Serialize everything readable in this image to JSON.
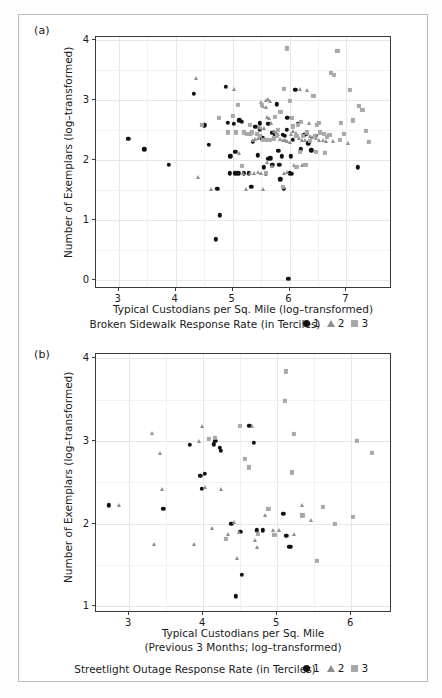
{
  "figure": {
    "panels": [
      {
        "label": "(a)",
        "legend_title": "Broken Sidewalk Response Rate (in Terciles)",
        "legend_items": [
          {
            "symbol": "circle",
            "label": "1"
          },
          {
            "symbol": "triangle",
            "label": "2"
          },
          {
            "symbol": "square",
            "label": "3"
          }
        ]
      },
      {
        "label": "(b)",
        "legend_title": "Streetlight Outage Response Rate (in Terciles)",
        "legend_items": [
          {
            "symbol": "circle",
            "label": "1"
          },
          {
            "symbol": "triangle",
            "label": "2"
          },
          {
            "symbol": "square",
            "label": "3"
          }
        ]
      }
    ]
  },
  "chart_data": [
    {
      "type": "scatter",
      "panel": "(a)",
      "title": "",
      "xlabel": "Typical Custodians per Sq. Mile (log–transformed)",
      "ylabel": "Number of Exemplars (log–transformed)",
      "xlim": [
        2.6,
        7.8
      ],
      "ylim": [
        -0.15,
        4.05
      ],
      "xticks": [
        3,
        4,
        5,
        6,
        7
      ],
      "yticks": [
        0,
        1,
        2,
        3,
        4
      ],
      "grid": true,
      "legend_position": "below-axis",
      "legend_title": "Broken Sidewalk Response Rate (in Terciles)",
      "series": [
        {
          "name": "1",
          "marker": "circle",
          "color": "#111111",
          "points": [
            [
              3.17,
              2.35
            ],
            [
              3.45,
              2.18
            ],
            [
              3.88,
              1.92
            ],
            [
              4.32,
              3.1
            ],
            [
              4.5,
              2.58
            ],
            [
              4.58,
              2.25
            ],
            [
              4.88,
              3.22
            ],
            [
              4.92,
              2.62
            ],
            [
              5.02,
              2.6
            ],
            [
              5.12,
              2.66
            ],
            [
              5.16,
              2.64
            ],
            [
              4.96,
              2.06
            ],
            [
              5.05,
              2.14
            ],
            [
              5.2,
              1.78
            ],
            [
              5.28,
              1.78
            ],
            [
              5.33,
              1.55
            ],
            [
              5.4,
              2.55
            ],
            [
              5.48,
              2.5
            ],
            [
              5.52,
              2.36
            ],
            [
              5.55,
              1.88
            ],
            [
              5.58,
              1.77
            ],
            [
              5.62,
              2.02
            ],
            [
              5.66,
              2.03
            ],
            [
              5.7,
              2.45
            ],
            [
              5.74,
              2.4
            ],
            [
              5.78,
              2.93
            ],
            [
              5.8,
              2.15
            ],
            [
              5.84,
              1.68
            ],
            [
              5.88,
              2.42
            ],
            [
              5.92,
              2.4
            ],
            [
              5.96,
              2.7
            ],
            [
              6.0,
              1.78
            ],
            [
              6.04,
              1.77
            ],
            [
              6.1,
              3.17
            ],
            [
              6.14,
              2.6
            ],
            [
              6.2,
              2.18
            ],
            [
              6.3,
              2.44
            ],
            [
              6.38,
              2.16
            ],
            [
              6.46,
              2.4
            ],
            [
              5.05,
              1.78
            ],
            [
              5.1,
              1.78
            ],
            [
              4.73,
              1.52
            ],
            [
              4.78,
              1.08
            ],
            [
              4.7,
              0.68
            ],
            [
              5.9,
              1.52
            ],
            [
              5.98,
              0.02
            ],
            [
              7.2,
              1.88
            ],
            [
              5.35,
              2.3
            ],
            [
              5.44,
              2.08
            ],
            [
              5.86,
              2.06
            ],
            [
              6.02,
              2.06
            ],
            [
              6.26,
              2.42
            ],
            [
              5.48,
              2.61
            ],
            [
              5.63,
              2.6
            ],
            [
              5.95,
              2.5
            ],
            [
              6.33,
              2.28
            ],
            [
              4.95,
              1.78
            ],
            [
              5.7,
              1.92
            ],
            [
              5.82,
              1.92
            ],
            [
              6.06,
              2.34
            ]
          ]
        },
        {
          "name": "2",
          "marker": "triangle",
          "color": "#8f8f8f",
          "points": [
            [
              4.36,
              3.36
            ],
            [
              4.4,
              1.72
            ],
            [
              4.62,
              1.52
            ],
            [
              5.02,
              3.19
            ],
            [
              5.22,
              2.46
            ],
            [
              5.3,
              2.44
            ],
            [
              5.36,
              2.34
            ],
            [
              5.4,
              2.35
            ],
            [
              5.44,
              2.36
            ],
            [
              5.5,
              2.97
            ],
            [
              5.54,
              2.9
            ],
            [
              5.58,
              2.88
            ],
            [
              5.6,
              2.72
            ],
            [
              5.64,
              2.7
            ],
            [
              5.68,
              2.62
            ],
            [
              5.72,
              2.48
            ],
            [
              5.76,
              2.46
            ],
            [
              5.8,
              2.44
            ],
            [
              5.84,
              2.35
            ],
            [
              5.88,
              2.34
            ],
            [
              5.92,
              2.33
            ],
            [
              5.96,
              2.31
            ],
            [
              6.0,
              2.3
            ],
            [
              6.06,
              2.48
            ],
            [
              6.12,
              2.45
            ],
            [
              6.16,
              2.36
            ],
            [
              6.22,
              2.34
            ],
            [
              6.28,
              2.33
            ],
            [
              6.34,
              2.62
            ],
            [
              6.4,
              2.38
            ],
            [
              6.46,
              2.36
            ],
            [
              6.52,
              2.34
            ],
            [
              6.58,
              2.34
            ],
            [
              6.64,
              2.32
            ],
            [
              6.76,
              2.32
            ],
            [
              7.02,
              2.28
            ],
            [
              5.12,
              2.12
            ],
            [
              5.18,
              1.78
            ],
            [
              5.3,
              1.78
            ],
            [
              5.38,
              1.78
            ],
            [
              5.44,
              1.8
            ],
            [
              5.5,
              1.78
            ],
            [
              5.6,
              1.96
            ],
            [
              5.7,
              1.9
            ],
            [
              5.9,
              1.78
            ],
            [
              5.96,
              1.8
            ],
            [
              6.08,
              1.92
            ],
            [
              6.22,
              1.92
            ],
            [
              5.24,
              1.52
            ],
            [
              5.54,
              1.52
            ],
            [
              6.18,
              3.19
            ],
            [
              6.3,
              3.16
            ],
            [
              5.46,
              2.55
            ],
            [
              5.5,
              2.53
            ],
            [
              5.56,
              2.54
            ],
            [
              5.58,
              3.0
            ],
            [
              5.62,
              3.02
            ],
            [
              5.66,
              2.98
            ],
            [
              6.02,
              2.44
            ],
            [
              6.36,
              2.4
            ]
          ]
        },
        {
          "name": "3",
          "marker": "square",
          "color": "#a8a8a8",
          "points": [
            [
              4.46,
              2.58
            ],
            [
              4.76,
              2.7
            ],
            [
              5.0,
              2.74
            ],
            [
              5.1,
              2.92
            ],
            [
              5.2,
              2.46
            ],
            [
              5.26,
              2.44
            ],
            [
              5.34,
              2.46
            ],
            [
              5.42,
              2.44
            ],
            [
              5.48,
              2.4
            ],
            [
              5.54,
              2.33
            ],
            [
              5.6,
              2.33
            ],
            [
              5.66,
              2.34
            ],
            [
              5.72,
              2.36
            ],
            [
              5.78,
              2.4
            ],
            [
              5.84,
              2.8
            ],
            [
              5.9,
              3.19
            ],
            [
              5.96,
              3.86
            ],
            [
              6.0,
              2.98
            ],
            [
              6.06,
              2.56
            ],
            [
              6.12,
              2.4
            ],
            [
              6.18,
              2.14
            ],
            [
              6.24,
              2.4
            ],
            [
              6.3,
              2.46
            ],
            [
              6.36,
              2.32
            ],
            [
              6.42,
              3.07
            ],
            [
              6.48,
              2.58
            ],
            [
              6.54,
              2.46
            ],
            [
              6.6,
              2.44
            ],
            [
              6.66,
              2.38
            ],
            [
              6.72,
              3.45
            ],
            [
              6.78,
              3.42
            ],
            [
              6.84,
              3.82
            ],
            [
              6.9,
              2.62
            ],
            [
              6.96,
              2.44
            ],
            [
              7.06,
              3.17
            ],
            [
              7.12,
              2.66
            ],
            [
              7.22,
              2.9
            ],
            [
              7.28,
              2.84
            ],
            [
              7.34,
              2.48
            ],
            [
              7.4,
              2.3
            ],
            [
              5.16,
              1.9
            ],
            [
              5.58,
              1.78
            ],
            [
              5.88,
              1.55
            ],
            [
              6.12,
              1.88
            ],
            [
              6.28,
              1.92
            ],
            [
              6.46,
              2.14
            ],
            [
              6.62,
              2.12
            ],
            [
              6.88,
              2.34
            ],
            [
              4.92,
              2.46
            ],
            [
              5.06,
              2.46
            ],
            [
              5.52,
              2.92
            ],
            [
              5.74,
              2.72
            ],
            [
              6.04,
              2.7
            ],
            [
              6.2,
              2.64
            ],
            [
              6.44,
              2.4
            ],
            [
              6.7,
              2.42
            ],
            [
              5.3,
              2.58
            ],
            [
              5.8,
              2.5
            ],
            [
              6.14,
              2.58
            ],
            [
              6.52,
              2.62
            ]
          ]
        }
      ]
    },
    {
      "type": "scatter",
      "panel": "(b)",
      "title": "",
      "xlabel": "Typical Custodians per Sq. Mile (Previous 3 Months; log–transformed)",
      "xlabel_line1": "Typical Custodians per Sq. Mile",
      "xlabel_line2": "(Previous 3 Months; log–transformed)",
      "ylabel": "Number of Exemplars (log–transformed)",
      "xlim": [
        2.55,
        6.55
      ],
      "ylim": [
        0.92,
        4.05
      ],
      "xticks": [
        3,
        4,
        5,
        6
      ],
      "yticks": [
        1,
        2,
        3,
        4
      ],
      "grid": true,
      "legend_position": "below-axis",
      "legend_title": "Streetlight Outage Response Rate (in Terciles)",
      "series": [
        {
          "name": "1",
          "marker": "circle",
          "color": "#111111",
          "points": [
            [
              2.72,
              2.22
            ],
            [
              3.46,
              2.18
            ],
            [
              3.82,
              2.95
            ],
            [
              3.96,
              2.58
            ],
            [
              3.98,
              2.42
            ],
            [
              4.16,
              3.0
            ],
            [
              4.22,
              2.92
            ],
            [
              4.24,
              2.88
            ],
            [
              4.38,
              2.0
            ],
            [
              4.5,
              1.9
            ],
            [
              4.62,
              3.18
            ],
            [
              4.68,
              2.98
            ],
            [
              4.72,
              1.92
            ],
            [
              5.08,
              2.12
            ],
            [
              5.12,
              1.85
            ],
            [
              5.16,
              1.72
            ],
            [
              5.18,
              1.72
            ],
            [
              4.52,
              1.38
            ],
            [
              4.44,
              1.12
            ],
            [
              4.8,
              1.92
            ],
            [
              4.14,
              2.96
            ],
            [
              4.02,
              2.6
            ]
          ]
        },
        {
          "name": "2",
          "marker": "triangle",
          "color": "#8f8f8f",
          "points": [
            [
              2.86,
              2.22
            ],
            [
              3.3,
              3.1
            ],
            [
              3.42,
              2.85
            ],
            [
              3.44,
              2.42
            ],
            [
              3.98,
              3.18
            ],
            [
              3.94,
              3.0
            ],
            [
              4.02,
              2.44
            ],
            [
              4.24,
              2.42
            ],
            [
              4.12,
              1.95
            ],
            [
              4.34,
              1.88
            ],
            [
              4.42,
              2.02
            ],
            [
              4.66,
              3.18
            ],
            [
              4.7,
              1.8
            ],
            [
              4.72,
              1.72
            ],
            [
              4.84,
              2.1
            ],
            [
              4.94,
              1.92
            ],
            [
              5.02,
              1.92
            ],
            [
              5.22,
              1.88
            ],
            [
              5.34,
              2.22
            ],
            [
              3.88,
              1.75
            ],
            [
              3.34,
              1.75
            ],
            [
              4.48,
              1.9
            ],
            [
              4.46,
              1.58
            ],
            [
              5.46,
              2.05
            ]
          ]
        },
        {
          "name": "3",
          "marker": "square",
          "color": "#a8a8a8",
          "points": [
            [
              4.08,
              3.02
            ],
            [
              4.16,
              3.04
            ],
            [
              4.5,
              3.18
            ],
            [
              4.56,
              2.78
            ],
            [
              4.62,
              2.68
            ],
            [
              4.74,
              1.88
            ],
            [
              4.88,
              2.18
            ],
            [
              5.12,
              3.84
            ],
            [
              5.1,
              3.48
            ],
            [
              5.22,
              3.08
            ],
            [
              5.2,
              2.62
            ],
            [
              5.34,
              2.1
            ],
            [
              5.62,
              2.2
            ],
            [
              5.78,
              2.0
            ],
            [
              6.08,
              3.0
            ],
            [
              6.28,
              2.85
            ],
            [
              6.02,
              2.08
            ],
            [
              4.3,
              1.82
            ],
            [
              4.96,
              1.86
            ],
            [
              5.54,
              1.55
            ]
          ]
        }
      ]
    }
  ]
}
